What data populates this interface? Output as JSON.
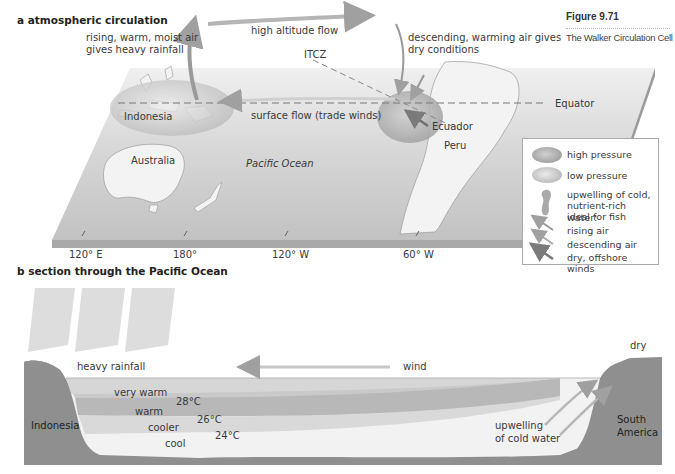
{
  "figure": {
    "number": "Figure 9.71",
    "caption": "The Walker Circulation Cell"
  },
  "panel_a": {
    "title": "a  atmospheric circulation",
    "labels": {
      "rising_line1": "rising, warm, moist air",
      "rising_line2": "gives heavy rainfall",
      "high_altitude_flow": "high altitude flow",
      "itcz": "ITCZ",
      "descending_line1": "descending, warming air gives",
      "descending_line2": "dry conditions",
      "equator": "Equator",
      "indonesia": "Indonesia",
      "surface_flow": "surface flow (trade winds)",
      "ecuador": "Ecuador",
      "peru": "Peru",
      "australia": "Australia",
      "pacific_ocean": "Pacific Ocean"
    },
    "longitudes": [
      "120° E",
      "180°",
      "120° W",
      "60° W"
    ]
  },
  "legend": {
    "items": [
      {
        "symbol": "high-pressure-ellipse",
        "label": "high pressure"
      },
      {
        "symbol": "low-pressure-ellipse",
        "label": "low pressure"
      },
      {
        "symbol": "upwelling-blob",
        "label_line1": "upwelling of cold,",
        "label_line2": "nutrient-rich water:",
        "label_line3": "ideal for fish"
      },
      {
        "symbol": "rising-air-arrow",
        "label": "rising air"
      },
      {
        "symbol": "descending-air-arrow",
        "label": "descending air"
      },
      {
        "symbol": "offshore-wind-arrow",
        "label_line1": "dry, offshore",
        "label_line2": "winds"
      }
    ]
  },
  "panel_b": {
    "title": "b  section through the Pacific Ocean",
    "labels": {
      "heavy_rainfall": "heavy rainfall",
      "wind": "wind",
      "dry": "dry",
      "indonesia": "Indonesia",
      "south_america_line1": "South",
      "south_america_line2": "America",
      "upwelling_line1": "upwelling",
      "upwelling_line2": "of cold water"
    },
    "layers": [
      {
        "name": "very warm",
        "temp": "28°C"
      },
      {
        "name": "warm",
        "temp": "26°C"
      },
      {
        "name": "cooler",
        "temp": "24°C"
      },
      {
        "name": "cool",
        "temp": ""
      }
    ]
  },
  "colors": {
    "land_dark": "#8c8c8c",
    "map_plane": "#c9c9c9",
    "arrow": "#9a9a9a",
    "water_very_warm": "#c8c8c8",
    "water_warm": "#b4b4b4",
    "water_cooler": "#d8d8d8",
    "water_cool": "#f4f4f4"
  }
}
